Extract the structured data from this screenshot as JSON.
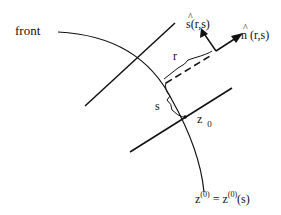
{
  "diagram": {
    "labels": {
      "front": "front",
      "s_hat": "s(r,s)",
      "n_hat": "n (r,s)",
      "r": "r",
      "s": "s",
      "z0_base": "z",
      "z0_sub": "0",
      "curve_eq_left": "z",
      "curve_eq_left_sup": "(0)",
      "curve_eq_mid": " = z",
      "curve_eq_mid_sup": "(0)",
      "curve_eq_right": "(s)",
      "hat_glyph": "^"
    }
  }
}
